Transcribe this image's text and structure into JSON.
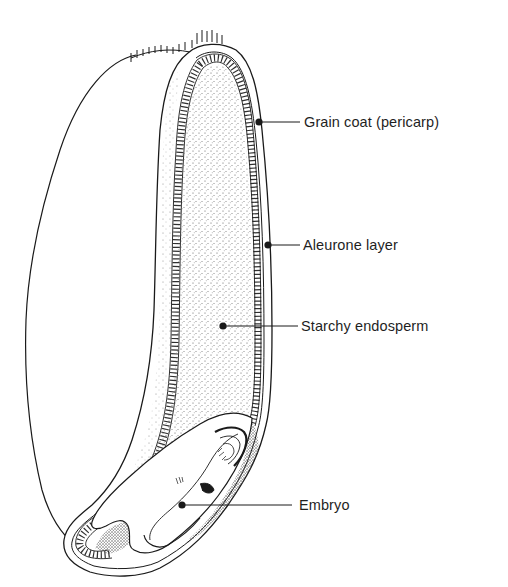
{
  "diagram": {
    "colors": {
      "ink": "#1a1a1a",
      "background": "#ffffff",
      "stipple": "#6a6a6a"
    },
    "labels": [
      {
        "id": "pericarp",
        "text": "Grain coat (pericarp)",
        "x": 304,
        "y": 120,
        "point": [
          259,
          122
        ]
      },
      {
        "id": "aleurone",
        "text": "Aleurone layer",
        "x": 303,
        "y": 237,
        "point": [
          268,
          245
        ]
      },
      {
        "id": "endosperm",
        "text": "Starchy endosperm",
        "x": 301,
        "y": 318,
        "point": [
          223,
          326
        ]
      },
      {
        "id": "embryo",
        "text": "Embryo",
        "x": 299,
        "y": 496,
        "point": [
          182,
          505
        ]
      }
    ]
  }
}
